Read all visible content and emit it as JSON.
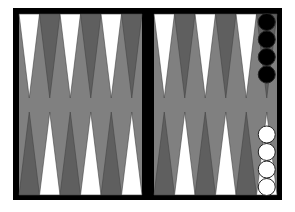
{
  "game": "backgammon",
  "colors": {
    "frame": "#000000",
    "felt": "#808080",
    "point_light": "#ffffff",
    "point_dark": "#5f5f5f",
    "checker_black": "#000000",
    "checker_white": "#ffffff"
  },
  "top_points": [
    "light",
    "dark",
    "light",
    "dark",
    "light",
    "dark",
    "light",
    "dark",
    "light",
    "dark",
    "light",
    "dark"
  ],
  "bottom_points": [
    "dark",
    "light",
    "dark",
    "light",
    "dark",
    "light",
    "dark",
    "light",
    "dark",
    "light",
    "dark",
    "light"
  ],
  "checkers": [
    {
      "color": "black",
      "column": 11,
      "side": "top",
      "count": 4
    },
    {
      "color": "white",
      "column": 11,
      "side": "bottom",
      "count": 4
    }
  ]
}
